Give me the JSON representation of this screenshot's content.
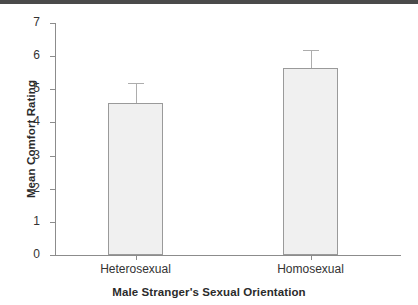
{
  "chart_data": {
    "type": "bar",
    "title": "",
    "xlabel": "Male Stranger's Sexual Orientation",
    "ylabel": "Mean Comfort Rating",
    "categories": [
      "Heterosexual",
      "Homosexual"
    ],
    "values": [
      4.6,
      5.65
    ],
    "errors_upper": [
      5.2,
      6.2
    ],
    "error_bar_lengths": [
      0.6,
      0.55
    ],
    "ylim": [
      0,
      7
    ],
    "ytick_labels": [
      "0",
      "1",
      "2",
      "3",
      "4",
      "5",
      "6",
      "7"
    ],
    "ytick_values": [
      0,
      1,
      2,
      3,
      4,
      5,
      6,
      7
    ],
    "grid": false,
    "legend": null,
    "bar_fill_color": "#f0f0f0",
    "bar_border_color": "#9a9a9a",
    "error_bar_color": "#adadad",
    "axis_color": "#8c8c8c",
    "text_color": "#333333"
  },
  "figure": {
    "top_strip_color": "#4a4a4a",
    "background_color": "#ffffff"
  }
}
